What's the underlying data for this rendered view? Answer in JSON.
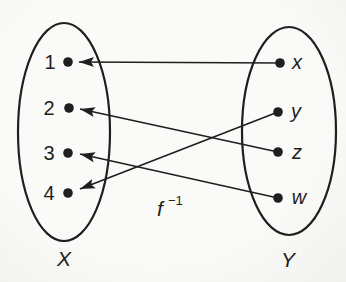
{
  "diagram": {
    "function_label": {
      "base": "f",
      "exponent": "−1"
    },
    "colors": {
      "ink": "#1f1f1f",
      "paper": "#fafaf8"
    },
    "left_set": {
      "label": "X",
      "elements": [
        "1",
        "2",
        "3",
        "4"
      ]
    },
    "right_set": {
      "label": "Y",
      "elements": [
        "x",
        "y",
        "z",
        "w"
      ]
    },
    "mappings": [
      {
        "from": "x",
        "to": "1"
      },
      {
        "from": "y",
        "to": "4"
      },
      {
        "from": "z",
        "to": "2"
      },
      {
        "from": "w",
        "to": "3"
      }
    ]
  }
}
